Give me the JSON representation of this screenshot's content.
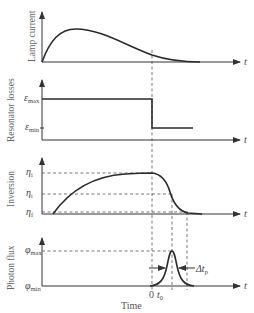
{
  "figure": {
    "x_label": "Time",
    "t_symbol": "t",
    "panels": [
      {
        "id": "lamp-current",
        "ylabel": "Lamp current",
        "description": "Pump lamp current pulse rising to a peak then decaying to zero"
      },
      {
        "id": "resonator-losses",
        "ylabel": "Resonator losses",
        "levels": [
          {
            "symbol": "ε",
            "sub": "max"
          },
          {
            "symbol": "ε",
            "sub": "min"
          }
        ],
        "description": "Losses held at max, then switched to min at Q-switch time"
      },
      {
        "id": "inversion",
        "ylabel": "Inversion",
        "levels": [
          {
            "symbol": "η",
            "sub": "i"
          },
          {
            "symbol": "η",
            "sub": "t"
          },
          {
            "symbol": "η",
            "sub": "f"
          }
        ],
        "description": "Inversion builds to initial value, then drops through threshold to final value"
      },
      {
        "id": "photon-flux",
        "ylabel": "Photon flux",
        "levels": [
          {
            "symbol": "φ",
            "sub": "max"
          },
          {
            "symbol": "φ",
            "sub": "min"
          }
        ],
        "time_marks": {
          "zero": "0",
          "t0_symbol": "t",
          "t0_sub": "0"
        },
        "pulse_width": {
          "symbol": "Δt",
          "sub": "p"
        },
        "description": "Giant pulse of photon flux peaking at t0"
      }
    ]
  }
}
